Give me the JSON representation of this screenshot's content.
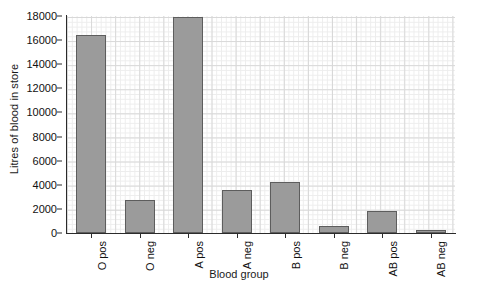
{
  "chart_data": {
    "type": "bar",
    "title": "",
    "xlabel": "Blood group",
    "ylabel": "Litres of blood in store",
    "categories": [
      "O pos",
      "O neg",
      "A pos",
      "A neg",
      "B pos",
      "B neg",
      "AB pos",
      "AB neg"
    ],
    "values": [
      16400,
      2750,
      17950,
      3600,
      4200,
      580,
      1830,
      250
    ],
    "ylim": [
      0,
      18000
    ],
    "yticks": [
      0,
      2000,
      4000,
      6000,
      8000,
      10000,
      12000,
      14000,
      16000,
      18000
    ],
    "ytick_labels": [
      "0",
      "2000",
      "4000",
      "6000",
      "8000",
      "10000",
      "12000",
      "14000",
      "16000",
      "18000"
    ],
    "grid": true,
    "grid_style": "fine minor grid with major gridlines",
    "legend": false,
    "bar_color": "#9b9b9b",
    "bar_edge_color": "#5d5d5d",
    "plot_background": "#ffffff",
    "axis_color": "#2b2b2b",
    "xtick_rotation": -90
  }
}
